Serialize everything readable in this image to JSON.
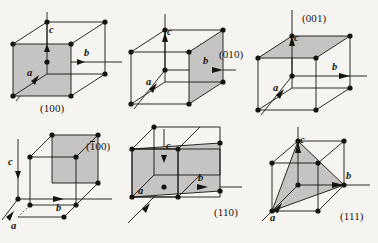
{
  "figure": {
    "background_color": "#f6f4f1",
    "line_color": "#17140f",
    "shade_color": "#c6c4c2",
    "vertex_color": "#17140f",
    "columns": 3,
    "rows": 2
  },
  "panels": [
    {
      "id": "panel-100",
      "plane_label": "(100)",
      "plane_label_prefix": "",
      "plane_label_suffix": "(100)",
      "has_overbar": false,
      "shaded_face": "front-left face (a-normal)",
      "axis_labels": {
        "a": "a",
        "b": "b",
        "c": "c"
      },
      "label_position": "below-cube"
    },
    {
      "id": "panel-010",
      "plane_label": "(010)",
      "plane_label_prefix": "",
      "plane_label_suffix": "(010)",
      "has_overbar": false,
      "shaded_face": "right face (b-normal)",
      "axis_labels": {
        "a": "a",
        "b": "b",
        "c": "c"
      },
      "label_position": "right-of-cube"
    },
    {
      "id": "panel-001",
      "plane_label": "(001)",
      "plane_label_prefix": "",
      "plane_label_suffix": "(001)",
      "has_overbar": false,
      "shaded_face": "top face (c-normal)",
      "axis_labels": {
        "a": "a",
        "b": "b",
        "c": "c"
      },
      "label_position": "above-cube"
    },
    {
      "id": "panel-1bar00",
      "plane_label": "(100)",
      "plane_label_prefix": "(",
      "plane_label_overbar_digit": "1",
      "plane_label_suffix": "00)",
      "has_overbar": true,
      "shaded_face": "rear face (negative a-normal)",
      "axis_labels": {
        "a": "a",
        "b": "b",
        "c": "c"
      },
      "label_position": "upper-right-of-cube"
    },
    {
      "id": "panel-110",
      "plane_label": "(110)",
      "plane_label_prefix": "",
      "plane_label_suffix": "(110)",
      "has_overbar": false,
      "shaded_face": "vertical diagonal plane through a and b intercepts",
      "axis_labels": {
        "a": "a",
        "b": "b",
        "c": "c"
      },
      "label_position": "lower-right-of-cube"
    },
    {
      "id": "panel-111",
      "plane_label": "(111)",
      "plane_label_prefix": "",
      "plane_label_suffix": "(111)",
      "has_overbar": false,
      "shaded_face": "triangular plane joining a, b and c intercepts",
      "axis_labels": {
        "a": "a",
        "b": "b",
        "c": "c"
      },
      "label_position": "lower-right-of-cube"
    }
  ]
}
